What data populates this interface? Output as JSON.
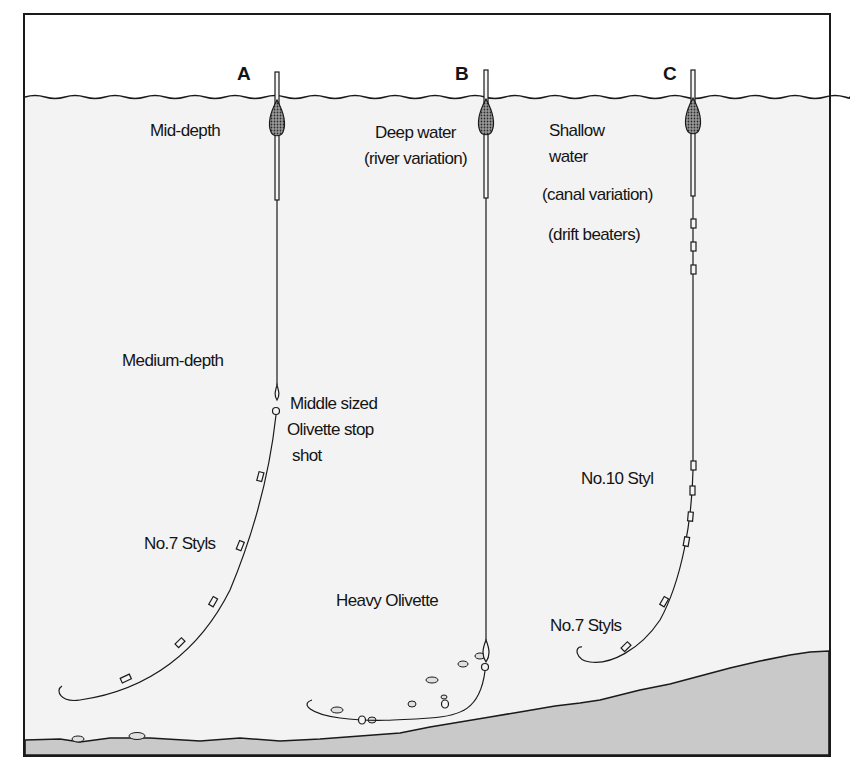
{
  "figure": {
    "type": "pole-float rig diagram",
    "colors": {
      "background_top": "#ffffff",
      "water": "#f3f3f3",
      "bed": "#c9c9c9",
      "ink": "#1a1a1a"
    }
  },
  "rigs": [
    {
      "letter": "A",
      "title": "Mid-depth",
      "labels": [
        "Medium-depth",
        "Middle sized",
        "Olivette stop",
        "shot",
        "No.7 Styls"
      ]
    },
    {
      "letter": "B",
      "title_lines": [
        "Deep water",
        "(river variation)"
      ],
      "labels": [
        "Heavy Olivette"
      ]
    },
    {
      "letter": "C",
      "title_lines": [
        "Shallow",
        "water",
        "(canal variation)",
        "(drift beaters)"
      ],
      "labels": [
        "No.10 Styl",
        "No.7 Styls"
      ]
    }
  ]
}
